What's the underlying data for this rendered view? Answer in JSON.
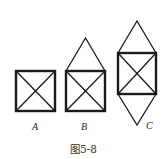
{
  "figure": {
    "caption": "图5-8",
    "shapes": [
      {
        "id": "A",
        "label": "A",
        "description": "square with both diagonals"
      },
      {
        "id": "B",
        "label": "B",
        "description": "square with both diagonals and a triangle on top"
      },
      {
        "id": "C",
        "label": "C",
        "description": "square with both diagonals and triangles on top and bottom"
      }
    ],
    "stroke_color": "#1a1a1a"
  }
}
